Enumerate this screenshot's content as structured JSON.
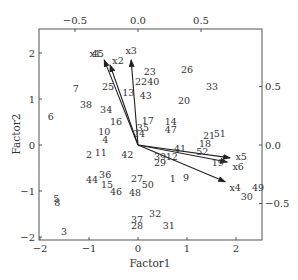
{
  "chart_data": {
    "type": "scatter",
    "subtype": "biplot",
    "title": "",
    "xlabel": "Factor1",
    "ylabel": "Factor2",
    "xlim": [
      -2,
      2.5
    ],
    "ylim": [
      -2,
      2.55
    ],
    "xticks": [
      -2,
      -1,
      0,
      1,
      2
    ],
    "xtick_labels": [
      "-2",
      "-1",
      "0",
      "1",
      "2"
    ],
    "yticks": [
      -2,
      -1,
      0,
      1,
      2
    ],
    "ytick_labels": [
      "-2",
      "-1",
      "0",
      "1",
      "2"
    ],
    "top_axis": {
      "ticks": [
        -0.5,
        0.0,
        0.5
      ],
      "tick_labels": [
        "-0.5",
        "0.0",
        "0.5"
      ],
      "lim": [
        -0.79,
        0.99
      ]
    },
    "right_axis": {
      "ticks": [
        0.5,
        0.0,
        -0.5
      ],
      "tick_labels": [
        "0.5",
        "0.0",
        "-0.5"
      ],
      "lim": [
        -0.79,
        0.99
      ]
    },
    "grid": false,
    "legend": null,
    "points": [
      {
        "label": "1",
        "x": 0.71,
        "y": -0.72
      },
      {
        "label": "2",
        "x": -1.0,
        "y": -0.2
      },
      {
        "label": "3",
        "x": -1.51,
        "y": -1.89
      },
      {
        "label": "4",
        "x": -0.67,
        "y": 0.11
      },
      {
        "label": "5",
        "x": -1.67,
        "y": -1.17
      },
      {
        "label": "6",
        "x": -1.78,
        "y": 0.61
      },
      {
        "label": "7",
        "x": -1.27,
        "y": 1.22
      },
      {
        "label": "8",
        "x": -1.65,
        "y": -1.26
      },
      {
        "label": "9",
        "x": 0.98,
        "y": -0.7
      },
      {
        "label": "10",
        "x": -0.69,
        "y": 0.3
      },
      {
        "label": "11",
        "x": -0.76,
        "y": -0.17
      },
      {
        "label": "12",
        "x": 0.69,
        "y": -0.26
      },
      {
        "label": "13",
        "x": -0.2,
        "y": 1.15
      },
      {
        "label": "14",
        "x": 0.67,
        "y": 0.52
      },
      {
        "label": "15",
        "x": -0.63,
        "y": -0.85
      },
      {
        "label": "16",
        "x": -0.45,
        "y": 0.52
      },
      {
        "label": "17",
        "x": 0.2,
        "y": 0.54
      },
      {
        "label": "18",
        "x": 1.37,
        "y": 0.04
      },
      {
        "label": "19",
        "x": 1.63,
        "y": -0.39
      },
      {
        "label": "20",
        "x": 0.94,
        "y": 0.96
      },
      {
        "label": "21",
        "x": 1.45,
        "y": 0.2
      },
      {
        "label": "22",
        "x": 0.06,
        "y": 1.39
      },
      {
        "label": "23",
        "x": 0.24,
        "y": 1.59
      },
      {
        "label": "24",
        "x": 0.02,
        "y": 0.24
      },
      {
        "label": "25",
        "x": -0.61,
        "y": 1.28
      },
      {
        "label": "26",
        "x": 1.0,
        "y": 1.65
      },
      {
        "label": "27",
        "x": -0.02,
        "y": -0.72
      },
      {
        "label": "28",
        "x": -0.02,
        "y": -1.74
      },
      {
        "label": "29",
        "x": 0.45,
        "y": -0.37
      },
      {
        "label": "30",
        "x": 2.22,
        "y": -1.11
      },
      {
        "label": "31",
        "x": 0.63,
        "y": -1.74
      },
      {
        "label": "32",
        "x": 0.35,
        "y": -1.48
      },
      {
        "label": "33",
        "x": 1.51,
        "y": 1.28
      },
      {
        "label": "34",
        "x": -0.65,
        "y": 0.78
      },
      {
        "label": "35",
        "x": 0.1,
        "y": 0.39
      },
      {
        "label": "36",
        "x": -0.67,
        "y": -0.65
      },
      {
        "label": "37",
        "x": -0.02,
        "y": -1.61
      },
      {
        "label": "38",
        "x": -1.06,
        "y": 0.87
      },
      {
        "label": "39",
        "x": 0.45,
        "y": -0.24
      },
      {
        "label": "40",
        "x": 0.31,
        "y": 1.37
      },
      {
        "label": "41",
        "x": 0.86,
        "y": -0.07
      },
      {
        "label": "42",
        "x": -0.22,
        "y": -0.2
      },
      {
        "label": "43",
        "x": 0.16,
        "y": 1.07
      },
      {
        "label": "44",
        "x": -0.94,
        "y": -0.76
      },
      {
        "label": "45",
        "x": -0.82,
        "y": 1.98
      },
      {
        "label": "46",
        "x": -0.45,
        "y": -1.02
      },
      {
        "label": "47",
        "x": 0.67,
        "y": 0.33
      },
      {
        "label": "48",
        "x": -0.06,
        "y": -1.04
      },
      {
        "label": "49",
        "x": 2.45,
        "y": -0.93
      },
      {
        "label": "50",
        "x": 0.2,
        "y": -0.85
      },
      {
        "label": "51",
        "x": 1.67,
        "y": 0.24
      },
      {
        "label": "52",
        "x": 1.31,
        "y": -0.15
      }
    ],
    "vectors": [
      {
        "label": "x1",
        "x": -0.69,
        "y": 1.85
      },
      {
        "label": "x2",
        "x": -0.57,
        "y": 1.74
      },
      {
        "label": "x3",
        "x": -0.14,
        "y": 1.85
      },
      {
        "label": "x4",
        "x": 1.78,
        "y": -0.8
      },
      {
        "label": "x5",
        "x": 1.88,
        "y": -0.28
      },
      {
        "label": "x6",
        "x": 1.82,
        "y": -0.37
      }
    ]
  }
}
